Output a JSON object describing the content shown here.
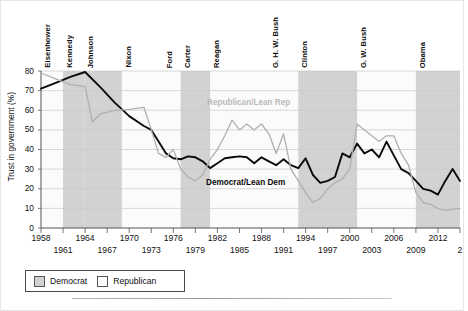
{
  "chart_data": {
    "type": "line",
    "title": "",
    "xlabel": "",
    "ylabel": "Trust in government (%)",
    "ylim": [
      0,
      80
    ],
    "ytick_values": [
      0,
      10,
      20,
      30,
      40,
      50,
      60,
      70,
      80
    ],
    "ytick_labels": [
      "0",
      "10",
      "20",
      "30",
      "40",
      "50",
      "60",
      "70",
      "80"
    ],
    "xlim": [
      1958,
      2015
    ],
    "xtick_labels_upper": [
      "1958",
      "1964",
      "1970",
      "1976",
      "1982",
      "1988",
      "1994",
      "2000",
      "2006",
      "2012"
    ],
    "xtick_values_upper": [
      1958,
      1964,
      1970,
      1976,
      1982,
      1988,
      1994,
      2000,
      2006,
      2012
    ],
    "xtick_labels_lower": [
      "1961",
      "1967",
      "1973",
      "1979",
      "1985",
      "1991",
      "1997",
      "2003",
      "2009",
      "2"
    ],
    "xtick_values_lower": [
      1961,
      1967,
      1973,
      1979,
      1985,
      1991,
      1997,
      2003,
      2009,
      2015
    ],
    "grid": true,
    "legend_position": "below-axis",
    "annotations": [
      {
        "text": "Republican/Lean Rep",
        "x": 1982,
        "y": 63,
        "color": "#b9b9b9"
      },
      {
        "text": "Democrat/Lean Dem",
        "x": 1982,
        "y": 24,
        "color": "#0a0a0a"
      }
    ],
    "presidential_terms": [
      {
        "name": "Eisenhower",
        "party": "Republican",
        "start": 1958,
        "end": 1961
      },
      {
        "name": "Kennedy",
        "party": "Democrat",
        "start": 1961,
        "end": 1963.9
      },
      {
        "name": "Johnson",
        "party": "Democrat",
        "start": 1963.9,
        "end": 1969
      },
      {
        "name": "Nixon",
        "party": "Republican",
        "start": 1969,
        "end": 1974.6
      },
      {
        "name": "Ford",
        "party": "Republican",
        "start": 1974.6,
        "end": 1977
      },
      {
        "name": "Carter",
        "party": "Democrat",
        "start": 1977,
        "end": 1981
      },
      {
        "name": "Reagan",
        "party": "Republican",
        "start": 1981,
        "end": 1989
      },
      {
        "name": "G. H. W. Bush",
        "party": "Republican",
        "start": 1989,
        "end": 1993
      },
      {
        "name": "Clinton",
        "party": "Democrat",
        "start": 1993,
        "end": 2001
      },
      {
        "name": "G. W. Bush",
        "party": "Republican",
        "start": 2001,
        "end": 2009
      },
      {
        "name": "Obama",
        "party": "Democrat",
        "start": 2009,
        "end": 2015
      }
    ],
    "series": [
      {
        "name": "Democrat/Lean Dem",
        "color": "#0a0a0a",
        "points": [
          [
            1958,
            71
          ],
          [
            1960,
            74
          ],
          [
            1962,
            77
          ],
          [
            1964,
            79.5
          ],
          [
            1966,
            72
          ],
          [
            1968,
            64
          ],
          [
            1970,
            57
          ],
          [
            1972,
            52
          ],
          [
            1973,
            50
          ],
          [
            1974,
            44
          ],
          [
            1975,
            38
          ],
          [
            1976,
            35.5
          ],
          [
            1977,
            35
          ],
          [
            1978,
            36.5
          ],
          [
            1979,
            36
          ],
          [
            1980,
            34
          ],
          [
            1981,
            30.5
          ],
          [
            1982,
            33
          ],
          [
            1983,
            35.5
          ],
          [
            1984,
            36
          ],
          [
            1985,
            36.5
          ],
          [
            1986,
            36
          ],
          [
            1987,
            33
          ],
          [
            1988,
            36
          ],
          [
            1989,
            34
          ],
          [
            1990,
            32
          ],
          [
            1991,
            35
          ],
          [
            1992,
            32
          ],
          [
            1993,
            30.5
          ],
          [
            1994,
            35.5
          ],
          [
            1995,
            27
          ],
          [
            1996,
            23
          ],
          [
            1997,
            24
          ],
          [
            1998,
            26
          ],
          [
            1999,
            38
          ],
          [
            2000,
            36
          ],
          [
            2001,
            43
          ],
          [
            2002,
            38
          ],
          [
            2003,
            40
          ],
          [
            2004,
            36
          ],
          [
            2005,
            44
          ],
          [
            2006,
            37
          ],
          [
            2007,
            30
          ],
          [
            2008,
            28
          ],
          [
            2009,
            24
          ],
          [
            2010,
            20
          ],
          [
            2011,
            19
          ],
          [
            2012,
            17
          ],
          [
            2013,
            24
          ],
          [
            2014,
            30
          ],
          [
            2015,
            24
          ]
        ]
      },
      {
        "name": "Republican/Lean Rep",
        "color": "#b0b0b0",
        "points": [
          [
            1958,
            79
          ],
          [
            1960,
            76
          ],
          [
            1962,
            73
          ],
          [
            1964,
            72
          ],
          [
            1965,
            54
          ],
          [
            1966,
            58
          ],
          [
            1968,
            60
          ],
          [
            1970,
            60.5
          ],
          [
            1972,
            61.5
          ],
          [
            1973,
            50
          ],
          [
            1974,
            38
          ],
          [
            1975,
            36
          ],
          [
            1976,
            40
          ],
          [
            1977,
            30
          ],
          [
            1978,
            26
          ],
          [
            1979,
            24
          ],
          [
            1980,
            27
          ],
          [
            1981,
            35
          ],
          [
            1982,
            40
          ],
          [
            1983,
            47
          ],
          [
            1984,
            55
          ],
          [
            1985,
            50
          ],
          [
            1986,
            53
          ],
          [
            1987,
            50
          ],
          [
            1988,
            53
          ],
          [
            1989,
            48
          ],
          [
            1990,
            38
          ],
          [
            1991,
            48
          ],
          [
            1992,
            30
          ],
          [
            1993,
            24
          ],
          [
            1994,
            18
          ],
          [
            1995,
            13
          ],
          [
            1996,
            15
          ],
          [
            1997,
            20
          ],
          [
            1998,
            23
          ],
          [
            1999,
            25
          ],
          [
            2000,
            30
          ],
          [
            2001,
            53
          ],
          [
            2002,
            50
          ],
          [
            2003,
            47
          ],
          [
            2004,
            44
          ],
          [
            2005,
            47
          ],
          [
            2006,
            47
          ],
          [
            2007,
            38
          ],
          [
            2008,
            32
          ],
          [
            2009,
            18
          ],
          [
            2010,
            13
          ],
          [
            2011,
            12
          ],
          [
            2012,
            10
          ],
          [
            2013,
            9
          ],
          [
            2015,
            10
          ]
        ]
      }
    ],
    "party_colors": {
      "Democrat": "#d2d2d2",
      "Republican": "#ffffff"
    },
    "plot_background": "#fbfbfb"
  },
  "legend": {
    "items": [
      {
        "label": "Democrat",
        "swatch": "#d2d2d2"
      },
      {
        "label": "Republican",
        "swatch": "#ffffff"
      }
    ]
  }
}
